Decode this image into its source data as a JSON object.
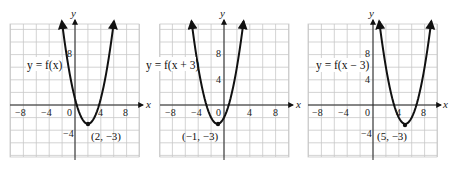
{
  "chart_data": [
    {
      "type": "line",
      "title": "",
      "function_label": "y = f(x)",
      "xlabel": "x",
      "ylabel": "y",
      "x_ticks": [
        -8,
        -4,
        0,
        4,
        8
      ],
      "y_ticks": [
        -4,
        4,
        8
      ],
      "xlim": [
        -10,
        10
      ],
      "ylim": [
        -8,
        13
      ],
      "grid": true,
      "grid_step": 2,
      "vertex": {
        "x": 2,
        "y": -3,
        "label": "(2, −3)"
      },
      "equation": "y = (x - 2)^2 - 3",
      "points": [
        [
          -1.6,
          10
        ],
        [
          0,
          1
        ],
        [
          2,
          -3
        ],
        [
          4,
          1
        ],
        [
          5.6,
          10
        ]
      ]
    },
    {
      "type": "line",
      "title": "",
      "function_label": "y = f(x + 3)",
      "xlabel": "x",
      "ylabel": "y",
      "x_ticks": [
        -8,
        -4,
        0,
        4,
        8
      ],
      "y_ticks": [
        4,
        8
      ],
      "xlim": [
        -10,
        10
      ],
      "ylim": [
        -8,
        13
      ],
      "grid": true,
      "grid_step": 2,
      "vertex": {
        "x": -1,
        "y": -3,
        "label": "(−1, −3)"
      },
      "equation": "y = (x + 1)^2 - 3",
      "points": [
        [
          -4.6,
          10
        ],
        [
          -3,
          1
        ],
        [
          -1,
          -3
        ],
        [
          1,
          1
        ],
        [
          2.6,
          10
        ]
      ]
    },
    {
      "type": "line",
      "title": "",
      "function_label": "y = f(x − 3)",
      "xlabel": "x",
      "ylabel": "y",
      "x_ticks": [
        -8,
        -4,
        0,
        4,
        8
      ],
      "y_ticks": [
        -4,
        4,
        8
      ],
      "xlim": [
        -10,
        10
      ],
      "ylim": [
        -8,
        13
      ],
      "grid": true,
      "grid_step": 2,
      "vertex": {
        "x": 5,
        "y": -3,
        "label": "(5, −3)"
      },
      "equation": "y = (x - 5)^2 - 3",
      "points": [
        [
          1.4,
          10
        ],
        [
          3,
          1
        ],
        [
          5,
          -3
        ],
        [
          7,
          1
        ],
        [
          8.6,
          10
        ]
      ]
    }
  ],
  "graphs": [
    {
      "fn_label": "y = f(x)",
      "vertex_label": "(2, −3)",
      "x_axis_label": "x",
      "y_axis_label": "y",
      "tick_x": [
        "−8",
        "−4",
        "0",
        "4",
        "8"
      ],
      "tick_y_pos8": "8",
      "tick_y_pos4": "4",
      "tick_y_neg4": "−4"
    },
    {
      "fn_label": "y = f(x + 3)",
      "vertex_label": "(−1, −3)",
      "x_axis_label": "x",
      "y_axis_label": "y",
      "tick_x": [
        "−8",
        "−4",
        "0",
        "4",
        "8"
      ],
      "tick_y_pos8": "8",
      "tick_y_pos4": "4"
    },
    {
      "fn_label": "y = f(x − 3)",
      "vertex_label": "(5, −3)",
      "x_axis_label": "x",
      "y_axis_label": "y",
      "tick_x": [
        "−8",
        "−4",
        "0",
        "4",
        "8"
      ],
      "tick_y_pos8": "8",
      "tick_y_pos4": "4",
      "tick_y_neg4": "−4"
    }
  ]
}
